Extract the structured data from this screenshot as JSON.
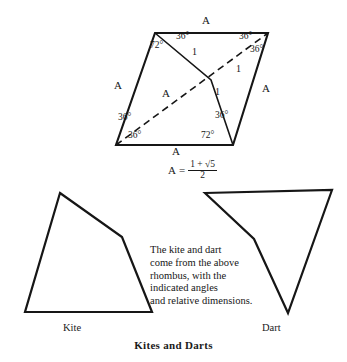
{
  "figure": {
    "title": "Kites and Darts",
    "caption": "The kite and dart come from the above rhombus, with the indicated angles and relative dimensions.",
    "caption_lines": [
      "The kite and dart",
      "come from the above",
      "rhombus, with the",
      "indicated angles",
      "and relative dimensions."
    ],
    "formula": {
      "lhs": "A",
      "equals": "=",
      "numerator": "1 + √5",
      "denominator": "2",
      "full": "A = (1 + √5) / 2"
    },
    "stroke_color": "#161616",
    "background_color": "#ffffff"
  },
  "rhombus": {
    "name": "golden rhombus with 72/108 degree angles",
    "side_label": "A",
    "unit_label": "1",
    "vertices": {
      "top_left": [
        155,
        33
      ],
      "top_right": [
        268,
        33
      ],
      "bottom_right": [
        233,
        145
      ],
      "bottom_left": [
        116,
        145
      ],
      "interior": [
        211,
        80
      ]
    },
    "side_labels": [
      {
        "text": "A",
        "x": 202,
        "y": 16
      },
      {
        "text": "A",
        "x": 114,
        "y": 80
      },
      {
        "text": "A",
        "x": 262,
        "y": 83
      },
      {
        "text": "A",
        "x": 172,
        "y": 146
      },
      {
        "text": "A",
        "x": 162,
        "y": 88
      }
    ],
    "angle_labels": [
      {
        "text": "72°",
        "x": 154,
        "y": 41
      },
      {
        "text": "36°",
        "x": 178,
        "y": 33
      },
      {
        "text": "36°",
        "x": 242,
        "y": 33
      },
      {
        "text": "36°",
        "x": 252,
        "y": 47
      },
      {
        "text": "36°",
        "x": 123,
        "y": 114
      },
      {
        "text": "36°",
        "x": 131,
        "y": 132
      },
      {
        "text": "36°",
        "x": 218,
        "y": 112
      },
      {
        "text": "72°",
        "x": 206,
        "y": 132
      }
    ],
    "segment_labels": [
      {
        "text": "1",
        "x": 192,
        "y": 48
      },
      {
        "text": "1",
        "x": 236,
        "y": 65
      },
      {
        "text": "1",
        "x": 215,
        "y": 88
      }
    ]
  },
  "kite": {
    "label": "Kite",
    "vertices": [
      [
        60,
        193
      ],
      [
        122,
        237
      ],
      [
        152,
        312
      ],
      [
        25,
        312
      ]
    ]
  },
  "dart": {
    "label": "Dart",
    "vertices": [
      [
        205,
        193
      ],
      [
        332,
        190
      ],
      [
        288,
        313
      ],
      [
        254,
        239
      ]
    ]
  }
}
